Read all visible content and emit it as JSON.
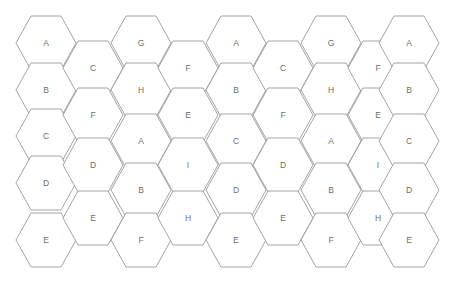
{
  "diagram": {
    "type": "hex-grid",
    "background_color": "#ffffff",
    "stroke_color": "#9a9a9a",
    "label_color": "#6e6e6e",
    "canvas": {
      "width": 455,
      "height": 281
    },
    "geometry": {
      "orientation": "flat-top",
      "hex_half_width": 30,
      "hex_half_height": 27,
      "column_pitch_x": 47.4,
      "row_pitch_y": 47.0,
      "column_offset_y": 23.5,
      "origin_x": 46,
      "origin_y": 43
    },
    "columns": [
      {
        "index": 0,
        "center_x": 46,
        "offset": false,
        "cells": [
          {
            "label": "A",
            "center_y": 43
          },
          {
            "label": "B",
            "center_y": 90
          },
          {
            "label": "C",
            "center_y": 136
          },
          {
            "label": "D",
            "center_y": 183
          },
          {
            "label": "E",
            "center_y": 240
          }
        ]
      },
      {
        "index": 1,
        "center_x": 93,
        "offset": true,
        "cells": [
          {
            "label": "C",
            "center_y": 68
          },
          {
            "label": "F",
            "center_y": 115
          },
          {
            "label": "D",
            "center_y": 165
          },
          {
            "label": "E",
            "center_y": 218
          }
        ]
      },
      {
        "index": 2,
        "center_x": 141,
        "offset": false,
        "cells": [
          {
            "label": "G",
            "center_y": 43
          },
          {
            "label": "H",
            "center_y": 90
          },
          {
            "label": "A",
            "center_y": 141
          },
          {
            "label": "B",
            "center_y": 190
          },
          {
            "label": "F",
            "center_y": 240
          }
        ]
      },
      {
        "index": 3,
        "center_x": 188,
        "offset": true,
        "cells": [
          {
            "label": "F",
            "center_y": 68
          },
          {
            "label": "E",
            "center_y": 115
          },
          {
            "label": "I",
            "center_y": 165
          },
          {
            "label": "H",
            "center_y": 218
          }
        ]
      },
      {
        "index": 4,
        "center_x": 236,
        "offset": false,
        "cells": [
          {
            "label": "A",
            "center_y": 43
          },
          {
            "label": "B",
            "center_y": 90
          },
          {
            "label": "C",
            "center_y": 141
          },
          {
            "label": "D",
            "center_y": 190
          },
          {
            "label": "E",
            "center_y": 240
          }
        ]
      },
      {
        "index": 5,
        "center_x": 283,
        "offset": true,
        "cells": [
          {
            "label": "C",
            "center_y": 68
          },
          {
            "label": "F",
            "center_y": 115
          },
          {
            "label": "D",
            "center_y": 165
          },
          {
            "label": "E",
            "center_y": 218
          }
        ]
      },
      {
        "index": 6,
        "center_x": 331,
        "offset": false,
        "cells": [
          {
            "label": "G",
            "center_y": 43
          },
          {
            "label": "H",
            "center_y": 90
          },
          {
            "label": "A",
            "center_y": 141
          },
          {
            "label": "B",
            "center_y": 190
          },
          {
            "label": "F",
            "center_y": 240
          }
        ]
      },
      {
        "index": 7,
        "center_x": 378,
        "offset": true,
        "cells": [
          {
            "label": "F",
            "center_y": 68
          },
          {
            "label": "E",
            "center_y": 115
          },
          {
            "label": "I",
            "center_y": 165
          },
          {
            "label": "H",
            "center_y": 218
          }
        ]
      },
      {
        "index": 8,
        "center_x": 409,
        "offset": false,
        "cells": [
          {
            "label": "A",
            "center_y": 43
          },
          {
            "label": "B",
            "center_y": 90
          },
          {
            "label": "C",
            "center_y": 141
          },
          {
            "label": "D",
            "center_y": 190
          },
          {
            "label": "E",
            "center_y": 240
          }
        ]
      }
    ]
  }
}
